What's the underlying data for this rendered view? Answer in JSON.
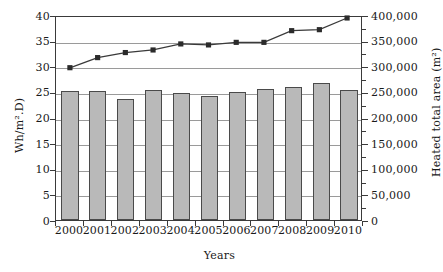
{
  "chart_data": {
    "type": "bar",
    "title": "",
    "xlabel": "Years",
    "ylabel_left": "Wh/m².D)",
    "ylabel_right": "Heated total area (m²)",
    "categories": [
      "2000",
      "2001",
      "2002",
      "2003",
      "2004",
      "2005",
      "2006",
      "2007",
      "2008",
      "2009",
      "2010"
    ],
    "series": [
      {
        "name": "Specific energy consumption",
        "type": "bar",
        "axis": "left",
        "unit": "Wh/m².D",
        "values": [
          25.1,
          25.2,
          23.7,
          25.3,
          24.7,
          24.3,
          25.0,
          25.6,
          26.0,
          26.8,
          25.3
        ]
      },
      {
        "name": "Heated total area",
        "type": "line",
        "axis": "right",
        "unit": "m²",
        "values": [
          300000,
          320000,
          330000,
          335000,
          347000,
          345000,
          350000,
          350000,
          373000,
          375000,
          398000
        ]
      }
    ],
    "left_axis": {
      "ticks": [
        0,
        5,
        10,
        15,
        20,
        25,
        30,
        35,
        40
      ],
      "ylim": [
        0,
        40
      ],
      "gridlines": true
    },
    "right_axis": {
      "ticks": [
        "0",
        "50,000",
        "100,000",
        "150,000",
        "200,000",
        "250,000",
        "300,000",
        "350,000",
        "400,000"
      ],
      "tick_values": [
        0,
        50000,
        100000,
        150000,
        200000,
        250000,
        300000,
        350000,
        400000
      ],
      "ylim": [
        0,
        400000
      ],
      "minor_ticks": true
    },
    "legend": "none",
    "grid": true,
    "colors": {
      "bar_fill": "#b9b9b9",
      "bar_border": "#4a4a4a",
      "line": "#3a3a3a",
      "marker": "#2b2b2b",
      "gridline": "#9a9a9a",
      "axis": "#3a3a3a"
    }
  }
}
